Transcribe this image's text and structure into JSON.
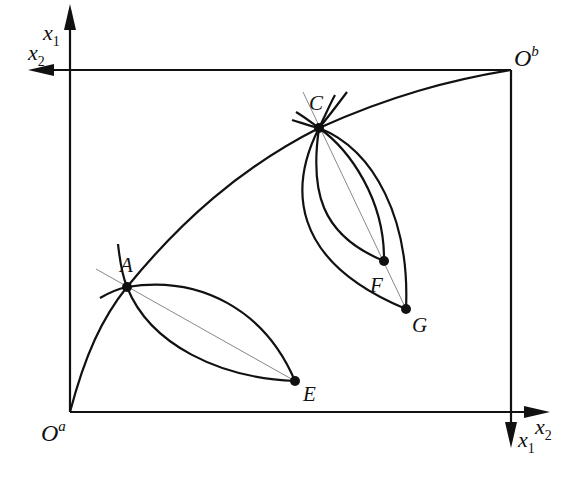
{
  "diagram": {
    "type": "edgeworth-box",
    "colors": {
      "line": "#111111",
      "guide": "#888888",
      "background": "#ffffff"
    },
    "origins": {
      "a": {
        "base": "O",
        "sup": "a"
      },
      "b": {
        "base": "O",
        "sup": "b"
      }
    },
    "axes": {
      "top_left": {
        "vertical": {
          "base": "x",
          "sub": "1"
        },
        "horizontal": {
          "base": "x",
          "sub": "2"
        }
      },
      "bottom_right": {
        "horizontal": {
          "base": "x",
          "sub": "2"
        },
        "vertical": {
          "base": "x",
          "sub": "1"
        }
      }
    },
    "points": [
      {
        "id": "A",
        "label": "A"
      },
      {
        "id": "C",
        "label": "C"
      },
      {
        "id": "E",
        "label": "E"
      },
      {
        "id": "F",
        "label": "F"
      },
      {
        "id": "G",
        "label": "G"
      }
    ]
  }
}
